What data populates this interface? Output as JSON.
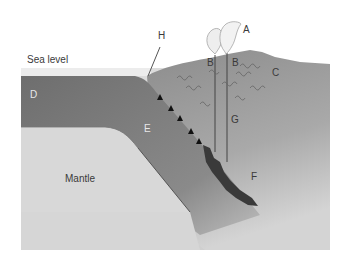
{
  "diagram": {
    "type": "subduction-zone cross-section",
    "labels": {
      "sea_level": "Sea level",
      "A": "A",
      "B_left": "B",
      "B_right": "B",
      "C": "C",
      "D": "D",
      "E": "E",
      "F": "F",
      "G": "G",
      "H": "H",
      "mantle": "Mantle"
    },
    "colors": {
      "background": "#ffffff",
      "sea_band": "#ececec",
      "oceanic_plate": "#707070",
      "continental_plate": "#8a8a8a",
      "mantle_light": "#d9d9d9",
      "magma": "#3c3c3c",
      "plume": "#e6e6e6"
    }
  }
}
